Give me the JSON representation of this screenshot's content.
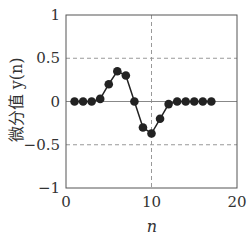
{
  "chart_data": {
    "type": "line",
    "title": "",
    "xlabel": "n",
    "ylabel": "微分值 y(n)",
    "xlim": [
      0,
      20
    ],
    "ylim": [
      -1,
      1
    ],
    "xticks": [
      0,
      10,
      20
    ],
    "xtick_labels": [
      "0",
      "10",
      "20"
    ],
    "yticks": [
      1,
      0.5,
      0,
      -0.5,
      -1
    ],
    "ytick_labels": [
      "1",
      "0.5",
      "0",
      "−0.5",
      "−1"
    ],
    "grid": {
      "dashed_x": [
        10
      ],
      "dashed_y": [
        0.5,
        -0.5
      ],
      "solid_y": [
        0
      ]
    },
    "legend": null,
    "series": [
      {
        "name": "y(n)",
        "marker": "filled-circle",
        "color": "#222222",
        "x": [
          1,
          2,
          3,
          4,
          5,
          6,
          7,
          8,
          9,
          10,
          11,
          12,
          13,
          14,
          15,
          16,
          17
        ],
        "values": [
          0,
          0,
          0,
          0.03,
          0.2,
          0.35,
          0.3,
          0.0,
          -0.3,
          -0.37,
          -0.2,
          -0.03,
          0,
          0,
          0,
          0,
          0
        ]
      }
    ]
  }
}
